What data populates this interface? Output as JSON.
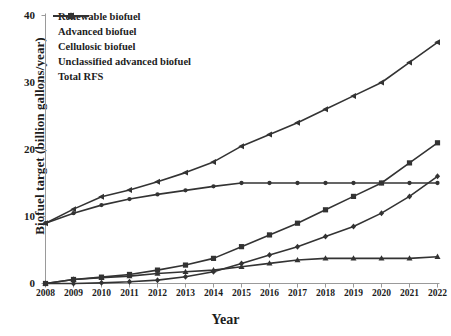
{
  "chart_data": {
    "type": "line",
    "title": "",
    "xlabel": "Year",
    "ylabel": "Biofuel target (billion gallons/year)",
    "x": [
      2008,
      2009,
      2010,
      2011,
      2012,
      2013,
      2014,
      2015,
      2016,
      2017,
      2018,
      2019,
      2020,
      2021,
      2022
    ],
    "xlim": [
      2008,
      2022
    ],
    "ylim": [
      0,
      40
    ],
    "yticks": [
      0,
      10,
      20,
      30,
      40
    ],
    "grid": false,
    "legend_position": "top-left",
    "series": [
      {
        "name": "Renewable biofuel",
        "marker": "circle",
        "values": [
          9.0,
          10.5,
          11.7,
          12.6,
          13.3,
          13.9,
          14.5,
          15.0,
          15.0,
          15.0,
          15.0,
          15.0,
          15.0,
          15.0,
          15.0
        ]
      },
      {
        "name": "Advanced biofuel",
        "marker": "square",
        "values": [
          0.0,
          0.6,
          0.95,
          1.35,
          2.0,
          2.75,
          3.75,
          5.5,
          7.25,
          9.0,
          11.0,
          13.0,
          15.0,
          18.0,
          21.0
        ]
      },
      {
        "name": "Cellulosic biofuel",
        "marker": "diamond",
        "values": [
          0.0,
          0.0,
          0.1,
          0.25,
          0.5,
          1.0,
          1.75,
          3.0,
          4.25,
          5.5,
          7.0,
          8.5,
          10.5,
          13.0,
          16.0
        ]
      },
      {
        "name": "Unclassified advanced biofuel",
        "marker": "triangle",
        "values": [
          0.0,
          0.6,
          0.85,
          1.1,
          1.5,
          1.75,
          2.0,
          2.5,
          3.0,
          3.5,
          3.75,
          3.75,
          3.75,
          3.75,
          4.0
        ]
      },
      {
        "name": "Total RFS",
        "marker": "left-triangle",
        "values": [
          9.0,
          11.1,
          12.95,
          13.95,
          15.2,
          16.55,
          18.15,
          20.5,
          22.25,
          24.0,
          26.0,
          28.0,
          30.0,
          33.0,
          36.0
        ]
      }
    ]
  },
  "colors": {
    "ink": "#333333",
    "axis": "#9a9a9a"
  }
}
